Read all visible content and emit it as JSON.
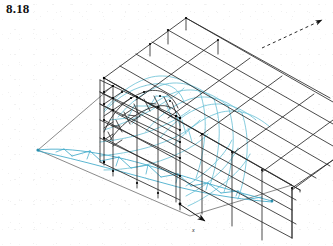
{
  "figure": {
    "label": "8.18",
    "caption_number": "8.18",
    "kind": "structural-wireframe-isometric"
  },
  "colors": {
    "structure_line": "#2b2b2b",
    "deformed_line": "#5fbcd3",
    "truss_line": "#3fa9c9",
    "ground_line": "#555555",
    "node_dot": "#000000",
    "background": "#ffffff",
    "label_text": "#111111"
  },
  "axes": {
    "origin_label": "",
    "x_axis_label": "x",
    "y_axis_label": "",
    "x_arrow_name": "x-axis-arrow",
    "y_arrow_name": "y-axis-arrow"
  },
  "geometry": {
    "front_frame": {
      "name": "front-portal-frame",
      "bays": 3,
      "levels": 5,
      "has_arch": true
    },
    "roof": {
      "name": "roof-purlin-grid",
      "purlins": 8,
      "posts": 3
    },
    "side_wall": {
      "name": "side-wall-grid",
      "rails": 6,
      "columns": 4
    },
    "detached_truss": {
      "name": "lens-arch-truss",
      "panels": 9,
      "shape": "lenticular"
    },
    "ground_plane": {
      "name": "ground-plane-outline",
      "shape": "parallelogram"
    }
  }
}
